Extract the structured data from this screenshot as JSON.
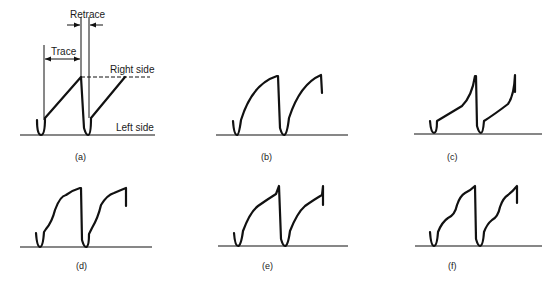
{
  "figure": {
    "panels": [
      {
        "id": "a",
        "label": "(a)",
        "description": "Linear sawtooth sweep"
      },
      {
        "id": "b",
        "label": "(b)",
        "description": "Compressed right side (convex sweep)"
      },
      {
        "id": "c",
        "label": "(c)",
        "description": "Compressed left side (concave sweep)"
      },
      {
        "id": "d",
        "label": "(d)",
        "description": "S-shaped sweep with kink near start"
      },
      {
        "id": "e",
        "label": "(e)",
        "description": "Convex sweep with mid-section flattening"
      },
      {
        "id": "f",
        "label": "(f)",
        "description": "Wavy sweep with multiple ripples"
      }
    ],
    "annotations": {
      "retrace": "Retrace",
      "trace": "Trace",
      "right_side": "Right side",
      "left_side": "Left side"
    }
  }
}
